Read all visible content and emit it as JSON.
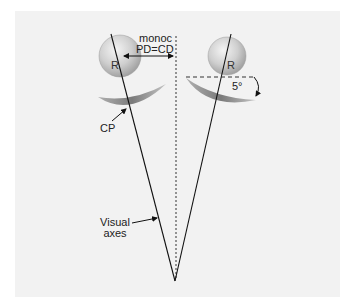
{
  "diagram": {
    "labels": {
      "left_eye": "R",
      "right_eye": "R",
      "monoc": "monoc",
      "pd_cd": "PD=CD",
      "angle": "5°",
      "cp": "CP",
      "visual_line1": "Visual",
      "visual_line2": "axes"
    },
    "colors": {
      "panel": "#f2f2f2",
      "line": "#1a1a1a",
      "ball": "#c8c8c8",
      "crescent": "#8a8a8a"
    }
  }
}
